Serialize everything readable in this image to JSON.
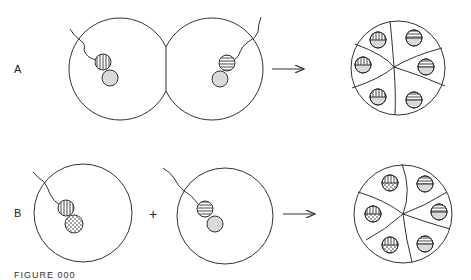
{
  "figure": {
    "caption": "FIGURE 000",
    "panels": [
      {
        "label": "A",
        "description": "Two adjacent fused cells, each with a nucleus pair and wavy tail, produce a rosette of six cells",
        "left_cell": {
          "striped": "vertical",
          "companion": "dotted"
        },
        "right_cell": {
          "striped": "horizontal",
          "companion": "dotted"
        },
        "operator": "",
        "arrow": "→",
        "result": {
          "segments": 6,
          "left_column_pattern": "vertical stripes over dotted",
          "right_column_pattern": "horizontal stripes over dotted"
        }
      },
      {
        "label": "B",
        "description": "Two separate cells combined produce a rosette of six cells",
        "left_cell": {
          "striped": "vertical",
          "companion": "stippled (large dots)"
        },
        "right_cell": {
          "striped": "horizontal",
          "companion": "dotted"
        },
        "operator": "+",
        "arrow": "→",
        "result": {
          "segments": 6,
          "left_column_pattern": "vertical stripes over stippled",
          "right_column_pattern": "horizontal stripes over dotted"
        }
      }
    ]
  },
  "colors": {
    "line": "#333333",
    "background": "#ffffff",
    "fill_dot": "#cccccc"
  }
}
